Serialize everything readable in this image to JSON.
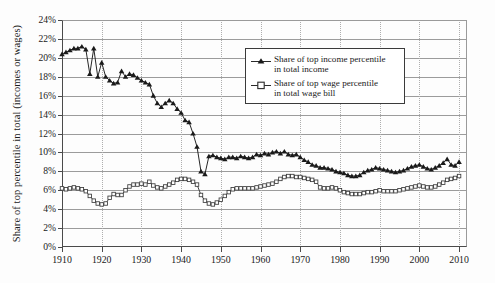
{
  "chart_data": {
    "type": "line",
    "title": "",
    "xlabel": "",
    "ylabel": "Share of top percentile in total (incomes or wages)",
    "xlim": [
      1910,
      2012
    ],
    "ylim": [
      0,
      24
    ],
    "grid": true,
    "legend_position": "upper-right",
    "ytick_labels": [
      "0%",
      "2%",
      "4%",
      "6%",
      "8%",
      "10%",
      "12%",
      "14%",
      "16%",
      "18%",
      "20%",
      "22%",
      "24%"
    ],
    "ytick_values": [
      0,
      2,
      4,
      6,
      8,
      10,
      12,
      14,
      16,
      18,
      20,
      22,
      24
    ],
    "xtick_labels": [
      "1910",
      "1920",
      "1930",
      "1940",
      "1950",
      "1960",
      "1970",
      "1980",
      "1990",
      "2000",
      "2010"
    ],
    "xtick_values": [
      1910,
      1920,
      1930,
      1940,
      1950,
      1960,
      1970,
      1980,
      1990,
      2000,
      2010
    ],
    "series": [
      {
        "name": "Share of top income percentile in total income",
        "legend_line1": "Share of top income percentile",
        "legend_line2": "in total income",
        "marker": "filled-triangle",
        "color": "#1a1a1a",
        "x": [
          1910,
          1911,
          1912,
          1913,
          1914,
          1915,
          1916,
          1917,
          1918,
          1919,
          1920,
          1921,
          1922,
          1923,
          1924,
          1925,
          1926,
          1927,
          1928,
          1929,
          1930,
          1931,
          1932,
          1933,
          1934,
          1935,
          1936,
          1937,
          1938,
          1939,
          1940,
          1941,
          1942,
          1943,
          1944,
          1945,
          1946,
          1947,
          1948,
          1949,
          1950,
          1951,
          1952,
          1953,
          1954,
          1955,
          1956,
          1957,
          1958,
          1959,
          1960,
          1961,
          1962,
          1963,
          1964,
          1965,
          1966,
          1967,
          1968,
          1969,
          1970,
          1971,
          1972,
          1973,
          1974,
          1975,
          1976,
          1977,
          1978,
          1979,
          1980,
          1981,
          1982,
          1983,
          1984,
          1985,
          1986,
          1987,
          1988,
          1989,
          1990,
          1991,
          1992,
          1993,
          1994,
          1995,
          1996,
          1997,
          1998,
          1999,
          2000,
          2001,
          2002,
          2003,
          2004,
          2005,
          2006,
          2007,
          2008,
          2009,
          2010
        ],
        "y": [
          20.4,
          20.6,
          20.8,
          21.0,
          21.0,
          21.2,
          20.9,
          18.3,
          21.0,
          18.0,
          19.5,
          18.0,
          17.6,
          17.3,
          17.4,
          18.6,
          18.0,
          18.3,
          18.2,
          17.9,
          17.6,
          17.4,
          17.2,
          16.0,
          15.2,
          14.8,
          15.2,
          15.5,
          15.2,
          14.6,
          14.2,
          13.4,
          13.2,
          12.0,
          10.6,
          8.0,
          7.7,
          9.6,
          9.7,
          9.5,
          9.4,
          9.3,
          9.5,
          9.5,
          9.4,
          9.6,
          9.5,
          9.4,
          9.5,
          9.8,
          9.7,
          9.9,
          9.8,
          10.0,
          10.1,
          9.9,
          10.1,
          9.8,
          9.7,
          9.8,
          9.5,
          9.2,
          9.0,
          8.7,
          8.6,
          8.4,
          8.4,
          8.3,
          8.2,
          8.0,
          7.9,
          7.8,
          7.6,
          7.5,
          7.5,
          7.6,
          7.9,
          8.1,
          8.2,
          8.4,
          8.3,
          8.2,
          8.1,
          8.0,
          7.9,
          8.0,
          8.1,
          8.3,
          8.5,
          8.6,
          8.7,
          8.5,
          8.3,
          8.2,
          8.4,
          8.6,
          8.9,
          9.3,
          8.7,
          8.6,
          9.0
        ]
      },
      {
        "name": "Share of top wage percentile in total wage bill",
        "legend_line1": "Share of top wage percentile",
        "legend_line2": "in total wage bill",
        "marker": "open-square",
        "color": "#3a3a3a",
        "x": [
          1910,
          1911,
          1912,
          1913,
          1914,
          1915,
          1916,
          1917,
          1918,
          1919,
          1920,
          1921,
          1922,
          1923,
          1924,
          1925,
          1926,
          1927,
          1928,
          1929,
          1930,
          1931,
          1932,
          1933,
          1934,
          1935,
          1936,
          1937,
          1938,
          1939,
          1940,
          1941,
          1942,
          1943,
          1944,
          1945,
          1946,
          1947,
          1948,
          1949,
          1950,
          1951,
          1952,
          1953,
          1954,
          1955,
          1956,
          1957,
          1958,
          1959,
          1960,
          1961,
          1962,
          1963,
          1964,
          1965,
          1966,
          1967,
          1968,
          1969,
          1970,
          1971,
          1972,
          1973,
          1974,
          1975,
          1976,
          1977,
          1978,
          1979,
          1980,
          1981,
          1982,
          1983,
          1984,
          1985,
          1986,
          1987,
          1988,
          1989,
          1990,
          1991,
          1992,
          1993,
          1994,
          1995,
          1996,
          1997,
          1998,
          1999,
          2000,
          2001,
          2002,
          2003,
          2004,
          2005,
          2006,
          2007,
          2008,
          2009,
          2010
        ],
        "y": [
          6.2,
          6.1,
          6.2,
          6.3,
          6.2,
          6.1,
          5.9,
          5.4,
          4.9,
          4.6,
          4.5,
          4.6,
          5.2,
          5.6,
          5.5,
          5.5,
          6.0,
          6.4,
          6.6,
          6.6,
          6.7,
          6.6,
          6.9,
          6.5,
          6.3,
          6.2,
          6.4,
          6.6,
          6.8,
          7.1,
          7.2,
          7.2,
          7.1,
          6.9,
          6.6,
          5.5,
          4.9,
          4.6,
          4.5,
          4.7,
          5.0,
          5.4,
          5.8,
          6.1,
          6.2,
          6.2,
          6.2,
          6.2,
          6.2,
          6.3,
          6.4,
          6.5,
          6.6,
          6.7,
          6.9,
          7.2,
          7.4,
          7.5,
          7.5,
          7.4,
          7.4,
          7.3,
          7.2,
          7.1,
          6.9,
          6.3,
          6.2,
          6.2,
          6.3,
          6.2,
          6.0,
          5.8,
          5.7,
          5.6,
          5.6,
          5.6,
          5.7,
          5.8,
          5.8,
          5.9,
          6.0,
          5.9,
          5.9,
          5.9,
          5.9,
          6.0,
          6.1,
          6.2,
          6.3,
          6.4,
          6.5,
          6.4,
          6.3,
          6.3,
          6.4,
          6.6,
          6.8,
          7.1,
          7.2,
          7.3,
          7.5
        ]
      }
    ]
  },
  "legend": {
    "items": [
      {
        "line1": "Share of top income percentile",
        "line2": "in total income",
        "marker": "filled-triangle"
      },
      {
        "line1": "Share of top wage percentile",
        "line2": "in total wage bill",
        "marker": "open-square"
      }
    ]
  }
}
